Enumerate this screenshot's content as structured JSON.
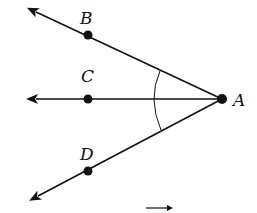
{
  "diagram": {
    "type": "geometry-angle-bisector",
    "vertex": {
      "label": "A",
      "x": 222,
      "y": 99
    },
    "rays": [
      {
        "name": "ray-AB",
        "point_label": "B",
        "px": 88,
        "py": 35,
        "tip_x": 36,
        "tip_y": 12,
        "label_x": 80,
        "label_y": 24
      },
      {
        "name": "ray-AC",
        "point_label": "C",
        "px": 88,
        "py": 99,
        "tip_x": 36,
        "tip_y": 99,
        "label_x": 81,
        "label_y": 82
      },
      {
        "name": "ray-AD",
        "point_label": "D",
        "px": 88,
        "py": 171,
        "tip_x": 38,
        "tip_y": 196,
        "label_x": 80,
        "label_y": 160
      }
    ],
    "vertex_label_pos": {
      "x": 233,
      "y": 106
    },
    "arc": {
      "start": [
        160,
        71
      ],
      "mid": [
        154,
        99
      ],
      "end": [
        161,
        130
      ]
    },
    "overarrow": {
      "x1": 146,
      "x2": 173,
      "y": 208
    },
    "colors": {
      "stroke": "#111111",
      "background": "#ffffff"
    }
  }
}
